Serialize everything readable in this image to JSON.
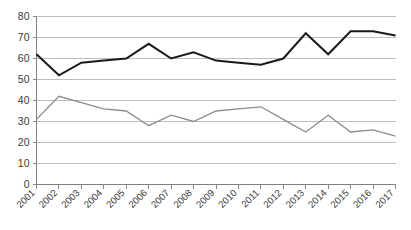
{
  "chart_data": {
    "type": "line",
    "title": "",
    "subtitle": "",
    "xlabel": "",
    "ylabel": "",
    "categories": [
      "2001",
      "2002",
      "2003",
      "2004",
      "2005",
      "2006",
      "2007",
      "2008",
      "2009",
      "2010",
      "2011",
      "2012",
      "2013",
      "2014",
      "2015",
      "2016",
      "2017"
    ],
    "ylim": [
      0,
      80
    ],
    "ytick_values": [
      0,
      10,
      20,
      30,
      40,
      50,
      60,
      70,
      80
    ],
    "ytick_labels": [
      "0",
      "10",
      "20",
      "30",
      "40",
      "50",
      "60",
      "70",
      "80"
    ],
    "grid": true,
    "grid_axis": "y",
    "legend": false,
    "legend_position": "none",
    "series": [
      {
        "name": "series-dark",
        "color": "#1a1a1a",
        "line_width": 2.0,
        "values": [
          62,
          52,
          58,
          59,
          60,
          67,
          60,
          63,
          59,
          58,
          57,
          60,
          72,
          62,
          73,
          73,
          71
        ]
      },
      {
        "name": "series-gray",
        "color": "#8c8c8c",
        "line_width": 1.3,
        "values": [
          31,
          42,
          39,
          36,
          35,
          28,
          33,
          30,
          35,
          36,
          37,
          31,
          25,
          33,
          25,
          26,
          23
        ]
      }
    ]
  },
  "axes": {
    "y_axis_name": "value-axis",
    "x_axis_name": "year-axis"
  }
}
